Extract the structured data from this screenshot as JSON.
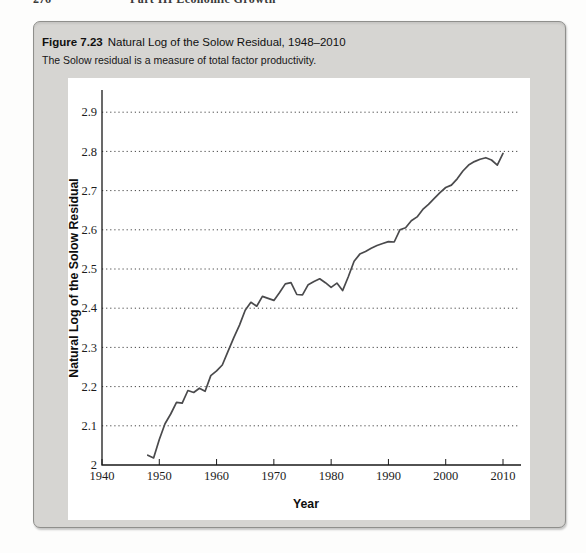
{
  "page": {
    "header_page_number": "276",
    "header_text": "Part III Economic Growth"
  },
  "figure": {
    "label": "Figure 7.23",
    "title": "Natural Log of the Solow Residual, 1948–2010",
    "caption": "The Solow residual is a measure of total factor productivity."
  },
  "colors": {
    "figure_box_fill": "#d6d5d2",
    "figure_box_border": "#8f8f8c",
    "chart_panel": "#ffffff",
    "data_line": "#4a4a4c",
    "axis": "#1a1a1a",
    "gridline": "#2f2f2f"
  },
  "chart_data": {
    "type": "line",
    "title": "",
    "xlabel": "Year",
    "ylabel": "Natural Log of the Solow Residual",
    "xlim": [
      1940,
      2013
    ],
    "ylim": [
      2.0,
      2.95
    ],
    "grid": "horizontal dotted lines at every 0.1 from 2.1 to 2.9",
    "legend_position": "none",
    "x_ticks": [
      1940,
      1950,
      1960,
      1970,
      1980,
      1990,
      2000,
      2010
    ],
    "y_ticks": [
      {
        "value": 2.0,
        "label": "2"
      },
      {
        "value": 2.1,
        "label": "2.1"
      },
      {
        "value": 2.2,
        "label": "2.2"
      },
      {
        "value": 2.3,
        "label": "2.3"
      },
      {
        "value": 2.4,
        "label": "2.4"
      },
      {
        "value": 2.5,
        "label": "2.5"
      },
      {
        "value": 2.6,
        "label": "2.6"
      },
      {
        "value": 2.7,
        "label": "2.7"
      },
      {
        "value": 2.8,
        "label": "2.8"
      },
      {
        "value": 2.9,
        "label": "2.9"
      }
    ],
    "gridlines_y": [
      2.1,
      2.2,
      2.3,
      2.4,
      2.5,
      2.6,
      2.7,
      2.8,
      2.9
    ],
    "series": [
      {
        "name": "Natural log of the Solow residual",
        "x": [
          1948,
          1949,
          1950,
          1951,
          1952,
          1953,
          1954,
          1955,
          1956,
          1957,
          1958,
          1959,
          1960,
          1961,
          1962,
          1963,
          1964,
          1965,
          1966,
          1967,
          1968,
          1969,
          1970,
          1971,
          1972,
          1973,
          1974,
          1975,
          1976,
          1977,
          1978,
          1979,
          1980,
          1981,
          1982,
          1983,
          1984,
          1985,
          1986,
          1987,
          1988,
          1989,
          1990,
          1991,
          1992,
          1993,
          1994,
          1995,
          1996,
          1997,
          1998,
          1999,
          2000,
          2001,
          2002,
          2003,
          2004,
          2005,
          2006,
          2007,
          2008,
          2009,
          2010
        ],
        "y": [
          2.025,
          2.018,
          2.065,
          2.105,
          2.13,
          2.16,
          2.158,
          2.19,
          2.185,
          2.196,
          2.188,
          2.228,
          2.24,
          2.255,
          2.29,
          2.325,
          2.357,
          2.395,
          2.415,
          2.405,
          2.43,
          2.425,
          2.42,
          2.44,
          2.462,
          2.465,
          2.435,
          2.434,
          2.46,
          2.468,
          2.475,
          2.465,
          2.453,
          2.464,
          2.445,
          2.48,
          2.52,
          2.538,
          2.545,
          2.553,
          2.56,
          2.565,
          2.57,
          2.569,
          2.6,
          2.605,
          2.623,
          2.633,
          2.652,
          2.665,
          2.68,
          2.695,
          2.708,
          2.714,
          2.73,
          2.75,
          2.765,
          2.774,
          2.78,
          2.784,
          2.778,
          2.765,
          2.795
        ]
      }
    ]
  }
}
